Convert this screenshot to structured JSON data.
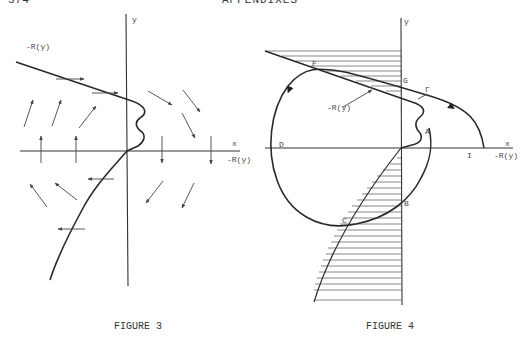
{
  "page": {
    "page_number": "374",
    "running_head": "APPENDIXES"
  },
  "figure3": {
    "caption": "FIGURE 3",
    "labels": {
      "y_axis": "y",
      "x_axis": "x",
      "curve_label": "-R(y)",
      "x_axis_sub": "-R(y)"
    },
    "description": "Direction field (arrows) around the curve x = -R(y); arrows horizontal on the curve, vertical on the x-axis"
  },
  "figure4": {
    "caption": "FIGURE 4",
    "labels": {
      "y_axis": "y",
      "x_axis": "x",
      "x_axis_sub": "-R(y)",
      "curve_label": "-R(y)",
      "gamma": "Γ",
      "points": [
        "F",
        "G",
        "A",
        "D",
        "I",
        "B",
        "C"
      ]
    },
    "description": "Trajectory Γ crossing curve -R(y); hatched regions between curve and y-axis"
  }
}
